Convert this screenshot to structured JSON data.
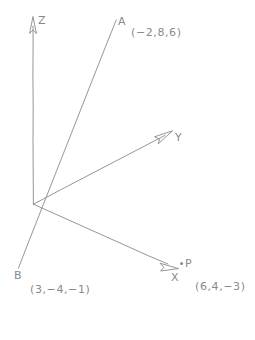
{
  "canvas": {
    "width": 255,
    "height": 340,
    "background": "#ffffff",
    "stroke": "#8a8a8a",
    "style": "hand-drawn pencil sketch"
  },
  "diagram": {
    "type": "3d-axes-sketch"
  },
  "axes": [
    {
      "id": "z",
      "label": "Z",
      "origin": [
        33,
        204
      ],
      "tip": [
        33,
        17
      ],
      "label_pos": [
        38,
        15
      ],
      "arrowhead": true
    },
    {
      "id": "y",
      "label": "Y",
      "origin": [
        33,
        204
      ],
      "tip": [
        172,
        131
      ],
      "label_pos": [
        175,
        132
      ],
      "arrowhead": true
    },
    {
      "id": "x",
      "label": "X",
      "origin": [
        33,
        204
      ],
      "tip": [
        178,
        268
      ],
      "label_pos": [
        171,
        272
      ],
      "arrowhead": true
    }
  ],
  "lines": [
    {
      "id": "line-ab",
      "from_label": "A",
      "to_label": "B",
      "from": [
        116,
        20
      ],
      "to": [
        18,
        268
      ]
    }
  ],
  "points": [
    {
      "id": "a",
      "label": "A",
      "coords_text": "(−2,8,6)",
      "coords": [
        -2,
        8,
        6
      ],
      "marker": false,
      "pos": [
        116,
        20
      ],
      "label_pos": [
        118,
        16
      ],
      "coord_label_pos": [
        131,
        27
      ]
    },
    {
      "id": "b",
      "label": "B",
      "coords_text": "(3,−4,−1)",
      "coords": [
        3,
        -4,
        -1
      ],
      "marker": false,
      "pos": [
        18,
        268
      ],
      "label_pos": [
        14,
        270
      ],
      "coord_label_pos": [
        30,
        284
      ]
    },
    {
      "id": "p",
      "label": "P",
      "coords_text": "(6,4,−3)",
      "coords": [
        6,
        4,
        -3
      ],
      "marker": true,
      "pos": [
        181,
        264
      ],
      "label_pos": [
        185,
        258
      ],
      "coord_label_pos": [
        195,
        281
      ]
    }
  ],
  "origin": {
    "label": "",
    "pos": [
      33,
      204
    ]
  }
}
